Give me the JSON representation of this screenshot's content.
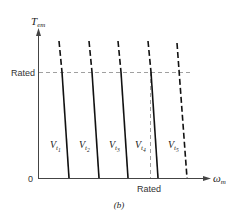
{
  "figure": {
    "caption": "(b)",
    "y_axis": {
      "symbol": "T",
      "subscript": "em"
    },
    "x_axis": {
      "symbol": "ω",
      "subscript": "m"
    },
    "origin_label": "0",
    "y_rated_label": "Rated",
    "x_rated_label": "Rated",
    "curves": [
      {
        "label": "V",
        "sub": "t",
        "subsub": "1"
      },
      {
        "label": "V",
        "sub": "t",
        "subsub": "2"
      },
      {
        "label": "V",
        "sub": "t",
        "subsub": "3"
      },
      {
        "label": "V",
        "sub": "t",
        "subsub": "4"
      },
      {
        "label": "V",
        "sub": "t",
        "subsub": "5"
      }
    ]
  }
}
